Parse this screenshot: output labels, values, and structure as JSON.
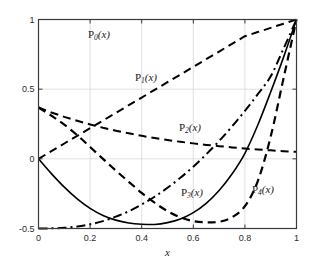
{
  "chart_data": {
    "type": "line",
    "title": "",
    "subtitle": "",
    "xlabel": "x",
    "ylabel": "",
    "xlim": [
      0,
      1
    ],
    "ylim": [
      -0.5,
      1
    ],
    "grid": true,
    "grid_style": "light vertical and horizontal gridlines at ticks",
    "legend": "inline curve labels placed next to each curve",
    "xticks": [
      0,
      0.2,
      0.4,
      0.6,
      0.8,
      1
    ],
    "xticklabels": [
      "0",
      "0.2",
      "0.4",
      "0.6",
      "0.8",
      "1"
    ],
    "yticks": [
      -0.5,
      0,
      0.5,
      1
    ],
    "yticklabels": [
      "-0.5",
      "0",
      "0.5",
      "1"
    ],
    "series": [
      {
        "name": "P_0(x)",
        "label": "P",
        "sub": "0",
        "arg": "(x)",
        "linestyle": "dashed",
        "color": "#000000",
        "linewidth": 2,
        "x": [
          0,
          0.05,
          0.1,
          0.15,
          0.2,
          0.25,
          0.3,
          0.35,
          0.4,
          0.45,
          0.5,
          0.55,
          0.6,
          0.65,
          0.7,
          0.75,
          0.8,
          0.85,
          0.9,
          0.95,
          1
        ],
        "values": [
          0.368,
          0.333,
          0.301,
          0.273,
          0.247,
          0.223,
          0.202,
          0.183,
          0.165,
          0.149,
          0.135,
          0.122,
          0.111,
          0.1,
          0.091,
          0.082,
          0.074,
          0.067,
          0.061,
          0.055,
          0.05
        ]
      },
      {
        "name": "P_1(x)",
        "label": "P",
        "sub": "1",
        "arg": "(x)",
        "linestyle": "dashed",
        "color": "#000000",
        "linewidth": 2,
        "x": [
          0,
          0.05,
          0.1,
          0.15,
          0.2,
          0.25,
          0.3,
          0.35,
          0.4,
          0.45,
          0.5,
          0.55,
          0.6,
          0.65,
          0.7,
          0.75,
          0.8,
          0.85,
          0.9,
          0.95,
          1
        ],
        "values": [
          0,
          0.055,
          0.11,
          0.165,
          0.22,
          0.275,
          0.33,
          0.385,
          0.44,
          0.495,
          0.55,
          0.605,
          0.66,
          0.715,
          0.77,
          0.825,
          0.88,
          0.91,
          0.94,
          0.97,
          1
        ]
      },
      {
        "name": "P_2(x)",
        "label": "P",
        "sub": "2",
        "arg": "(x)",
        "linestyle": "dashdot",
        "color": "#000000",
        "linewidth": 2,
        "x": [
          0,
          0.05,
          0.1,
          0.15,
          0.2,
          0.25,
          0.3,
          0.35,
          0.4,
          0.45,
          0.5,
          0.55,
          0.6,
          0.65,
          0.7,
          0.75,
          0.8,
          0.85,
          0.9,
          0.95,
          1
        ],
        "values": [
          -0.5,
          -0.499,
          -0.495,
          -0.486,
          -0.47,
          -0.447,
          -0.415,
          -0.376,
          -0.328,
          -0.272,
          -0.208,
          -0.136,
          -0.056,
          0.032,
          0.128,
          0.232,
          0.344,
          0.464,
          0.592,
          0.792,
          1
        ]
      },
      {
        "name": "P_3(x)",
        "label": "P",
        "sub": "3",
        "arg": "(x)",
        "linestyle": "solid",
        "color": "#000000",
        "linewidth": 1.6,
        "x": [
          0,
          0.05,
          0.1,
          0.15,
          0.2,
          0.25,
          0.3,
          0.35,
          0.4,
          0.45,
          0.5,
          0.55,
          0.6,
          0.65,
          0.7,
          0.75,
          0.8,
          0.85,
          0.9,
          0.95,
          1
        ],
        "values": [
          0,
          -0.106,
          -0.203,
          -0.287,
          -0.355,
          -0.406,
          -0.44,
          -0.46,
          -0.469,
          -0.471,
          -0.458,
          -0.432,
          -0.386,
          -0.319,
          -0.227,
          -0.109,
          0.04,
          0.243,
          0.48,
          0.73,
          1
        ]
      },
      {
        "name": "P_4(x)",
        "label": "P",
        "sub": "4",
        "arg": "(x)",
        "linestyle": "dashed",
        "color": "#000000",
        "linewidth": 2.2,
        "x": [
          0,
          0.05,
          0.1,
          0.15,
          0.2,
          0.25,
          0.3,
          0.35,
          0.4,
          0.45,
          0.5,
          0.55,
          0.6,
          0.65,
          0.7,
          0.75,
          0.8,
          0.85,
          0.9,
          0.95,
          1
        ],
        "values": [
          0.368,
          0.31,
          0.245,
          0.17,
          0.085,
          0.0,
          -0.085,
          -0.165,
          -0.245,
          -0.315,
          -0.375,
          -0.42,
          -0.447,
          -0.455,
          -0.452,
          -0.42,
          -0.34,
          -0.16,
          0.16,
          0.58,
          1
        ]
      }
    ],
    "annotations": [
      {
        "text": "P_0(x)",
        "label": "P",
        "sub": "0",
        "arg": "(x)",
        "x_px": 99,
        "y_px": 35
      },
      {
        "text": "P_1(x)",
        "label": "P",
        "sub": "1",
        "arg": "(x)",
        "x_px": 146,
        "y_px": 78
      },
      {
        "text": "P_2(x)",
        "label": "P",
        "sub": "2",
        "arg": "(x)",
        "x_px": 190,
        "y_px": 128
      },
      {
        "text": "P_3(x)",
        "label": "P",
        "sub": "3",
        "arg": "(x)",
        "x_px": 192,
        "y_px": 193
      },
      {
        "text": "P_4(x)",
        "label": "P",
        "sub": "4",
        "arg": "(x)",
        "x_px": 263,
        "y_px": 190
      }
    ],
    "colors": {
      "axis": "#3a3a3a",
      "grid": "#d8d8d8",
      "curve": "#000000",
      "background": "#ffffff",
      "text": "#1a1a1a"
    }
  }
}
